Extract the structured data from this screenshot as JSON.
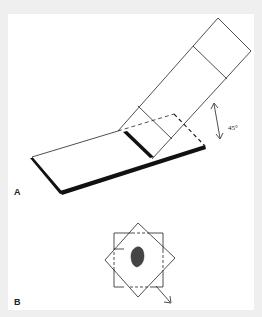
{
  "figure": {
    "panels": [
      {
        "id": "A",
        "label": "A",
        "angle_label": "45°",
        "description": "Slab with distal portion folded up at 45 degrees along hinge line"
      },
      {
        "id": "B",
        "label": "B",
        "description": "Square section with rotated overlay square around central dark specimen, arrow indicating rotation/direction"
      }
    ]
  },
  "colors": {
    "background": "#efefef",
    "panel": "#ffffff",
    "line": "#222222",
    "specimen": "#444444"
  }
}
